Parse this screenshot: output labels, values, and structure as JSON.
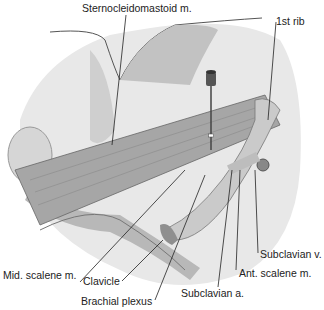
{
  "figure": {
    "type": "anatomical illustration",
    "labels": {
      "sternocleidomastoid": "Sternocleidomastoid m.",
      "first_rib": "1st rib",
      "subclavian_v": "Subclavian v.",
      "ant_scalene": "Ant. scalene m.",
      "subclavian_a": "Subclavian a.",
      "brachial_plexus": "Brachial plexus",
      "clavicle": "Clavicle",
      "mid_scalene": "Mid. scalene m."
    },
    "colors": {
      "background": "#ffffff",
      "skin_light": "#e6e6e6",
      "skin_mid": "#cfcfcf",
      "skin_dark": "#a9a9a9",
      "muscle": "#9a9a9a",
      "bone": "#d4d4d4",
      "line": "#222222"
    }
  }
}
